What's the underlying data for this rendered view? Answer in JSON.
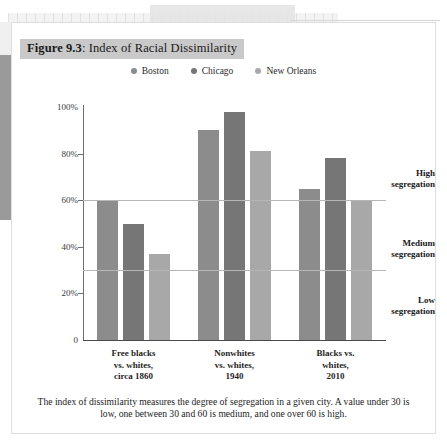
{
  "figure": {
    "number_label": "Figure 9.3",
    "separator": ": ",
    "title": "Index of Racial Dissimilarity",
    "caption": "The index of dissimilarity measures the degree of segregation in a given city. A value under 30 is low, one between 30 and 60 is medium, and one over 60 is high."
  },
  "colors": {
    "boston": "#8c8c8c",
    "chicago": "#767676",
    "new_orleans": "#a8a8a8",
    "title_highlight": "#c9c9c9",
    "reference_line": "#b6b6b6",
    "axis": "#4a4a4a"
  },
  "segregation_bands": [
    {
      "name": "high-segregation-label",
      "line1": "High",
      "line2": "segregation"
    },
    {
      "name": "medium-segregation-label",
      "line1": "Medium",
      "line2": "segregation"
    },
    {
      "name": "low-segregation-label",
      "line1": "Low",
      "line2": "segregation"
    }
  ],
  "chart_data": {
    "type": "bar",
    "title": "Index of Racial Dissimilarity",
    "xlabel": "",
    "ylabel": "",
    "ylim": [
      0,
      100
    ],
    "yticks": [
      0,
      20,
      40,
      60,
      80,
      100
    ],
    "ytick_labels": [
      "0",
      "20%",
      "40%",
      "60%",
      "80%",
      "100%"
    ],
    "grid": false,
    "legend_position": "top-center",
    "reference_lines": [
      {
        "value": 60,
        "label": "high threshold"
      },
      {
        "value": 30,
        "label": "low threshold"
      }
    ],
    "categories": [
      {
        "line1": "Free blacks",
        "line2": "vs. whites,",
        "line3": "circa 1860"
      },
      {
        "line1": "Nonwhites",
        "line2": "vs. whites,",
        "line3": "1940"
      },
      {
        "line1": "Blacks vs.",
        "line2": "whites,",
        "line3": "2010"
      }
    ],
    "category_labels": [
      "Free blacks vs. whites, circa 1860",
      "Nonwhites vs. whites, 1940",
      "Blacks vs. whites, 2010"
    ],
    "series": [
      {
        "name": "Boston",
        "color": "#8c8c8c",
        "values": [
          60,
          90,
          65
        ]
      },
      {
        "name": "Chicago",
        "color": "#767676",
        "values": [
          50,
          98,
          78
        ]
      },
      {
        "name": "New Orleans",
        "color": "#a8a8a8",
        "values": [
          37,
          81,
          60
        ]
      }
    ]
  }
}
